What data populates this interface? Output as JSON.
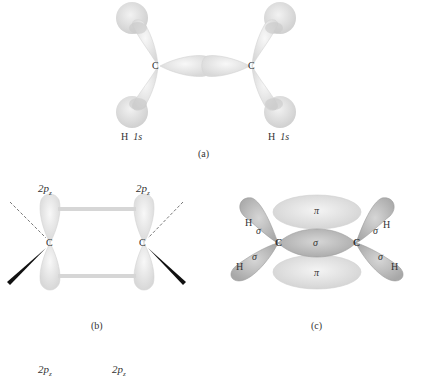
{
  "panel_a": {
    "caption": "(a)",
    "atom_left": "C",
    "atom_right": "C",
    "h_left": "H",
    "h_left_orbital": "1s",
    "h_right": "H",
    "h_right_orbital": "1s"
  },
  "panel_b": {
    "caption": "(b)",
    "orbital_left": "2p",
    "orbital_left_sub": "z",
    "orbital_right": "2p",
    "orbital_right_sub": "z",
    "atom_left": "C",
    "atom_right": "C"
  },
  "panel_c": {
    "caption": "(c)",
    "pi_top": "π",
    "pi_bottom": "π",
    "sigma_center": "σ",
    "atom_left": "C",
    "atom_right": "C",
    "h_labels": [
      "H",
      "H",
      "H",
      "H"
    ],
    "sigma_labels": [
      "σ",
      "σ",
      "σ",
      "σ"
    ]
  },
  "bottom_partial": {
    "orbital_left": "2p",
    "orbital_left_sub": "z",
    "orbital_right": "2p",
    "orbital_right_sub": "z"
  },
  "colors": {
    "light_lobe": "#e6e6e6",
    "dark_lobe": "#b4b4b4",
    "stroke": "#cfcfcf"
  }
}
